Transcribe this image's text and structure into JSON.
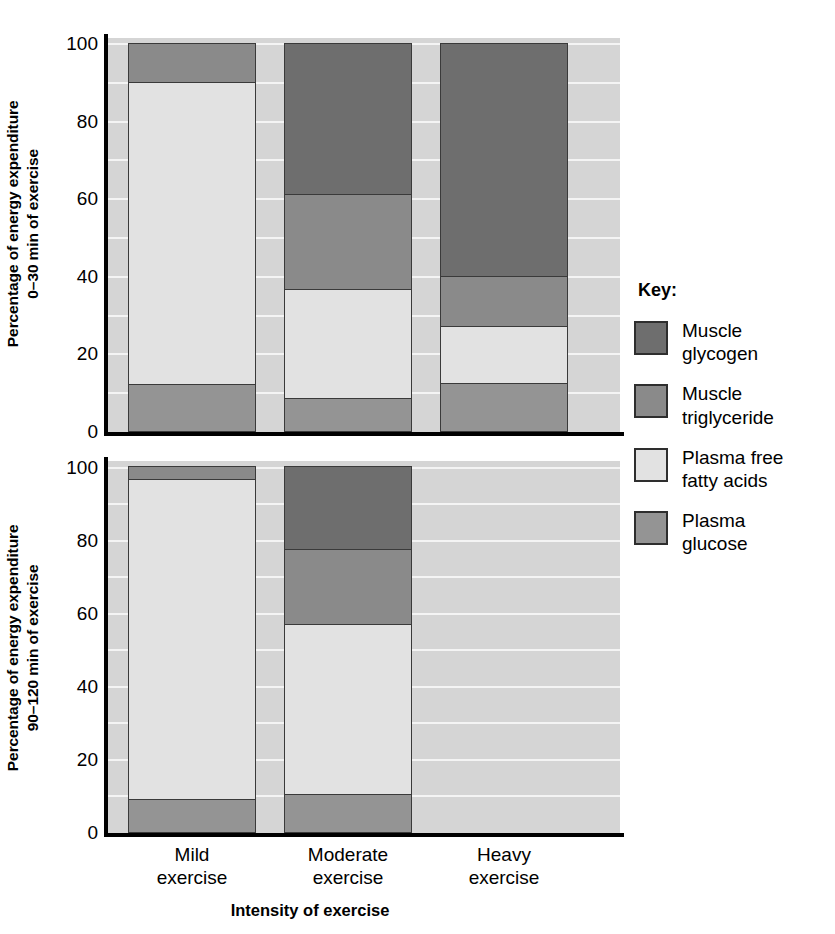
{
  "chart_data": {
    "type": "bar",
    "subtype": "stacked-bar",
    "title": "",
    "xlabel": "Intensity of exercise",
    "categories": [
      "Mild exercise",
      "Moderate exercise",
      "Heavy exercise"
    ],
    "ylim": [
      0,
      100
    ],
    "yticks": [
      0,
      20,
      40,
      60,
      80,
      100
    ],
    "ytick_labels": [
      "0",
      "20",
      "40",
      "60",
      "80",
      "100"
    ],
    "grid": true,
    "grid_interval": 10,
    "legend_position": "right",
    "legend_title": "Key:",
    "series_order": [
      "Plasma glucose",
      "Plasma free fatty acids",
      "Muscle triglyceride",
      "Muscle glycogen"
    ],
    "panels": [
      {
        "id": "top",
        "ylabel_line1": "Percentage of energy expenditure",
        "ylabel_line2": "0–30 min of exercise",
        "series": [
          {
            "name": "Plasma glucose",
            "color": "#949494",
            "values": [
              12,
              8.5,
              12.5
            ]
          },
          {
            "name": "Plasma free fatty acids",
            "color": "#e2e2e2",
            "values": [
              78,
              28,
              14.5
            ]
          },
          {
            "name": "Muscle triglyceride",
            "color": "#8a8a8a",
            "values": [
              10,
              24.5,
              13
            ]
          },
          {
            "name": "Muscle glycogen",
            "color": "#6e6e6e",
            "values": [
              0,
              39,
              60
            ]
          }
        ]
      },
      {
        "id": "bottom",
        "ylabel_line1": "Percentage of energy expenditure",
        "ylabel_line2": "90–120 min of exercise",
        "series": [
          {
            "name": "Plasma glucose",
            "color": "#949494",
            "values": [
              9,
              10.5,
              0
            ]
          },
          {
            "name": "Plasma free fatty acids",
            "color": "#e2e2e2",
            "values": [
              87.5,
              46.5,
              0
            ]
          },
          {
            "name": "Muscle triglyceride",
            "color": "#8a8a8a",
            "values": [
              3.5,
              20.5,
              0
            ]
          },
          {
            "name": "Muscle glycogen",
            "color": "#6e6e6e",
            "values": [
              0,
              22.5,
              0
            ]
          }
        ]
      }
    ]
  },
  "axes": {
    "tick_labels": [
      "100",
      "80",
      "60",
      "40",
      "20",
      "0"
    ],
    "x_tick_labels": [
      {
        "line1": "Mild",
        "line2": "exercise"
      },
      {
        "line1": "Moderate",
        "line2": "exercise"
      },
      {
        "line1": "Heavy",
        "line2": "exercise"
      }
    ],
    "x_axis_title": "Intensity of exercise",
    "top_y_title_line1": "Percentage of energy expenditure",
    "top_y_title_line2": "0–30 min of exercise",
    "bottom_y_title_line1": "Percentage of energy expenditure",
    "bottom_y_title_line2": "90–120 min of exercise"
  },
  "legend": {
    "title": "Key:",
    "items": [
      {
        "label_line1": "Muscle",
        "label_line2": "glycogen",
        "color": "#6e6e6e"
      },
      {
        "label_line1": "Muscle",
        "label_line2": "triglyceride",
        "color": "#8a8a8a"
      },
      {
        "label_line1": "Plasma free",
        "label_line2": "fatty acids",
        "color": "#e2e2e2"
      },
      {
        "label_line1": "Plasma",
        "label_line2": "glucose",
        "color": "#949494"
      }
    ]
  },
  "colors": {
    "plot_background": "#d5d5d5",
    "gridline": "#f4f4f4",
    "axis": "#000000",
    "bar_border": "#3a3a3a",
    "page_background": "#ffffff"
  }
}
